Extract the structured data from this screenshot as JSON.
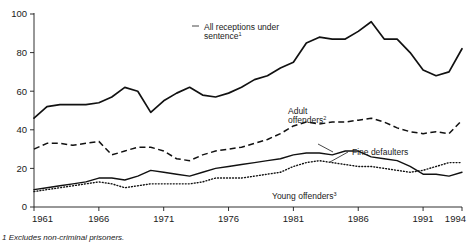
{
  "chart_data": {
    "type": "line",
    "title": "",
    "xlabel": "",
    "ylabel": "",
    "xlim": [
      1961,
      1994
    ],
    "ylim": [
      0,
      100
    ],
    "grid": false,
    "legend_position": "inline-annotations",
    "x": [
      1961,
      1962,
      1963,
      1964,
      1965,
      1966,
      1967,
      1968,
      1969,
      1970,
      1971,
      1972,
      1973,
      1974,
      1975,
      1976,
      1977,
      1978,
      1979,
      1980,
      1981,
      1982,
      1983,
      1984,
      1985,
      1986,
      1987,
      1988,
      1989,
      1990,
      1991,
      1992,
      1993,
      1994
    ],
    "xticks": [
      1961,
      1966,
      1971,
      1976,
      1981,
      1986,
      1991,
      1994
    ],
    "xtick_labels": [
      "1961",
      "1966",
      "1971",
      "1976",
      "1981",
      "1986",
      "1991",
      "1994"
    ],
    "yticks": [
      0,
      20,
      40,
      60,
      80,
      100
    ],
    "ytick_labels": [
      "0",
      "20",
      "40",
      "60",
      "80",
      "100"
    ],
    "series": [
      {
        "name": "All receptions under sentence",
        "footnote_marker": "1",
        "style": "solid-thick",
        "label_text": "All receptions under",
        "label_text2": "sentence",
        "values": [
          46,
          52,
          53,
          53,
          53,
          54,
          57,
          62,
          60,
          49,
          55,
          59,
          62,
          58,
          57,
          59,
          62,
          66,
          68,
          72,
          75,
          85,
          88,
          87,
          87,
          91,
          96,
          87,
          87,
          80,
          71,
          68,
          70,
          82
        ]
      },
      {
        "name": "Adult offenders",
        "footnote_marker": "2",
        "style": "dashed",
        "label_text": "Adult",
        "label_text2": "offenders",
        "values": [
          30,
          33,
          33,
          32,
          33,
          34,
          27,
          29,
          31,
          31,
          29,
          25,
          24,
          27,
          29,
          30,
          31,
          33,
          35,
          38,
          42,
          44,
          43,
          44,
          44,
          45,
          46,
          44,
          41,
          39,
          38,
          39,
          38,
          45
        ]
      },
      {
        "name": "Fine defaulters",
        "footnote_marker": "",
        "style": "solid-thin",
        "label_text": "Fine defaulters",
        "label_text2": "",
        "values": [
          9,
          10,
          11,
          12,
          13,
          15,
          15,
          14,
          16,
          19,
          18,
          17,
          16,
          18,
          20,
          21,
          22,
          23,
          24,
          25,
          27,
          28,
          28,
          27,
          29,
          29,
          26,
          25,
          24,
          21,
          17,
          17,
          16,
          18
        ]
      },
      {
        "name": "Young offenders",
        "footnote_marker": "3",
        "style": "dotted",
        "label_text": "Young offenders",
        "label_text2": "",
        "values": [
          8,
          9,
          10,
          11,
          12,
          13,
          12,
          10,
          11,
          12,
          12,
          12,
          12,
          13,
          15,
          15,
          15,
          16,
          17,
          18,
          21,
          23,
          24,
          23,
          22,
          21,
          21,
          20,
          19,
          18,
          19,
          21,
          23,
          23
        ]
      }
    ]
  },
  "footnote": {
    "text": "1  Excludes non-criminal prisoners."
  },
  "colors": {
    "ink": "#111111",
    "background": "#ffffff"
  }
}
